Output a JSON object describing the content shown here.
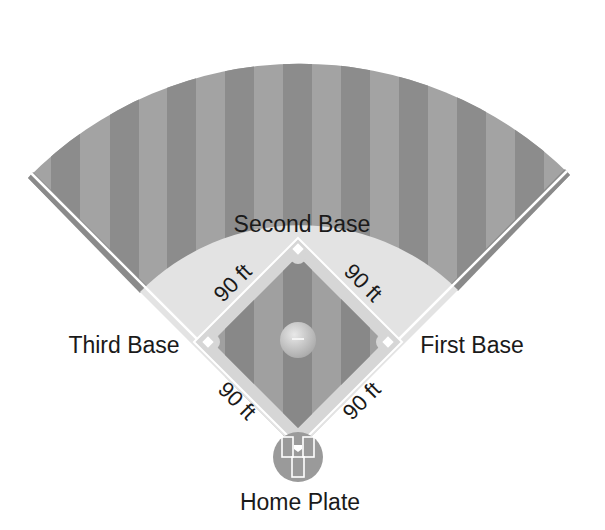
{
  "diagram": {
    "labels": {
      "second_base": "Second Base",
      "third_base": "Third Base",
      "first_base": "First Base",
      "home_plate": "Home Plate"
    },
    "distances": {
      "home_to_third": "90 ft",
      "third_to_second": "90 ft",
      "second_to_first": "90 ft",
      "first_to_home": "90 ft"
    },
    "colors": {
      "outfield_dark": "#8a8a8a",
      "outfield_light": "#a3a3a3",
      "infield_dirt": "#dcdcdc",
      "foul_line": "#ffffff",
      "warning_track": "#7e7e7e",
      "mound": "#c9c9c9",
      "text": "#1a1a1a"
    }
  }
}
